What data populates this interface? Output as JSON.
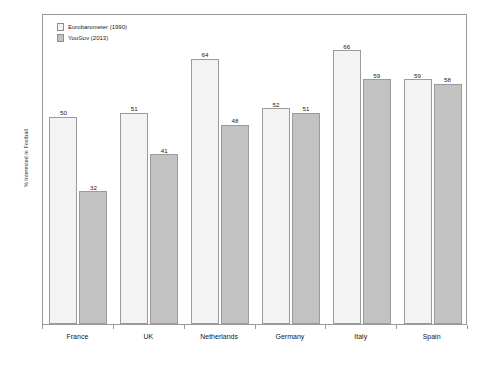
{
  "chart_data": {
    "type": "bar",
    "title": "",
    "subtitle": "",
    "xlabel": "",
    "ylabel": "% Interested in Football",
    "categories": [
      "France",
      "UK",
      "Netherlands",
      "Germany",
      "Italy",
      "Spain"
    ],
    "series": [
      {
        "name": "Eurobarometer (1990)",
        "color": "#f3f3f3",
        "values": [
          50,
          51,
          64,
          52,
          66,
          59
        ]
      },
      {
        "name": "YouGov (2013)",
        "color": "#c2c2c2",
        "values": [
          32,
          41,
          48,
          51,
          59,
          58
        ]
      }
    ],
    "ylim": [
      0,
      75
    ],
    "grid": false,
    "legend_position": "top-left",
    "data_labels": true
  },
  "legend": {
    "items": [
      {
        "label": "Eurobarometer (1990)",
        "swatch": "#f3f3f3"
      },
      {
        "label": "YouGov (2013)",
        "swatch": "#c2c2c2"
      }
    ]
  },
  "axes": {
    "y_title": "% Interested in Football",
    "x_tick_labels": [
      "France",
      "UK",
      "Netherlands",
      "Germany",
      "Italy",
      "Spain"
    ]
  },
  "colors": {
    "series_1_fill": "#f3f3f3",
    "series_2_fill": "#c2c2c2",
    "bar_stroke": "#9b9b9b",
    "frame": "#9a9a9a",
    "background": "#ffffff",
    "text": "#1a1a1a"
  }
}
